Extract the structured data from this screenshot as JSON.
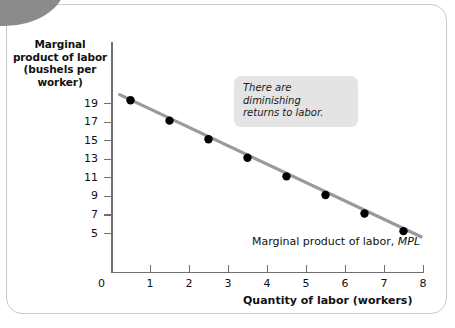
{
  "chart_data": {
    "type": "scatter",
    "title": "",
    "ylabel_lines": [
      "Marginal",
      "product of labor",
      "(bushels per",
      "worker)"
    ],
    "ylabel": "Marginal product of labor (bushels per worker)",
    "xlabel": "Quantity of labor (workers)",
    "xlim": [
      0,
      8
    ],
    "ylim": [
      4.3,
      20.3
    ],
    "grid": false,
    "legend": "none",
    "x_ticks": [
      0,
      1,
      2,
      3,
      4,
      5,
      6,
      7,
      8
    ],
    "x_tick_labels": [
      "0",
      "1",
      "2",
      "3",
      "4",
      "5",
      "6",
      "7",
      "8"
    ],
    "y_ticks": [
      5,
      7,
      9,
      11,
      13,
      15,
      17,
      19
    ],
    "y_tick_labels": [
      "5",
      "7",
      "9",
      "11",
      "13",
      "15",
      "17",
      "19"
    ],
    "series": [
      {
        "name": "Marginal product of labor, MPL",
        "type": "line+markers",
        "color": "#9a9a9a",
        "marker_color": "#000000",
        "x": [
          0.5,
          1.5,
          2.5,
          3.5,
          4.5,
          5.5,
          6.5,
          7.5
        ],
        "values": [
          19.3,
          17.1,
          15.1,
          13.1,
          11.1,
          9.1,
          7.1,
          5.2
        ]
      }
    ],
    "line_endpoints": {
      "x0": 0.22,
      "y0": 19.9,
      "x1": 7.95,
      "y1": 4.6
    },
    "annotations": [
      {
        "name": "diminishing-returns-callout",
        "text_lines": [
          "There are diminishing",
          "returns to labor."
        ],
        "text": "There are diminishing returns to labor.",
        "style": "italic-grey-box"
      },
      {
        "name": "curve-label",
        "text_plain": "Marginal product of labor,",
        "text_italic": "MPL",
        "text": "Marginal product of labor, MPL"
      }
    ],
    "colors": {
      "line": "#9a9a9a",
      "marker": "#000000",
      "axis": "#6f6f6f",
      "callout_bg": "#e4e4e4",
      "corner_tab": "#8b8b8b",
      "frame_border": "#c9c9c9",
      "text": "#111111",
      "background": "#ffffff"
    }
  },
  "axis_titles": {
    "y_line_1": "Marginal",
    "y_line_2": "product of labor",
    "y_line_3": "(bushels per",
    "y_line_4": "worker)",
    "x": "Quantity of labor (workers)"
  },
  "callout": {
    "line_1": "There are diminishing",
    "line_2": "returns to labor."
  },
  "curve_label": {
    "prefix": "Marginal product of labor,",
    "italic": "MPL"
  },
  "ticks": {
    "origin": "0",
    "x": [
      "1",
      "2",
      "3",
      "4",
      "5",
      "6",
      "7",
      "8"
    ],
    "y": [
      "19",
      "17",
      "15",
      "13",
      "11",
      "9",
      "7",
      "5"
    ]
  }
}
